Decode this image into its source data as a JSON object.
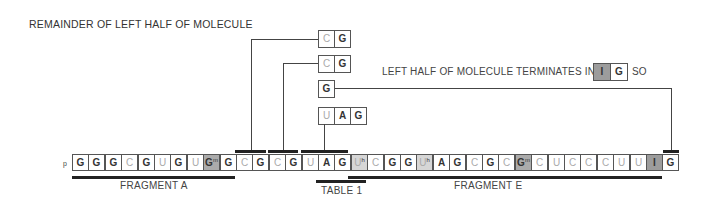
{
  "title": "REMAINDER OF LEFT HALF OF MOLECULE",
  "note": {
    "text": "LEFT HALF OF MOLECULE TERMINATES IN",
    "cells": [
      {
        "base": "I",
        "mod": "",
        "shade": "i"
      },
      {
        "base": "G",
        "mod": "",
        "shade": ""
      }
    ],
    "suffix": "SO"
  },
  "sequence": {
    "prefix": "p",
    "cells": [
      {
        "base": "G",
        "mod": "",
        "shade": ""
      },
      {
        "base": "G",
        "mod": "",
        "shade": ""
      },
      {
        "base": "G",
        "mod": "",
        "shade": ""
      },
      {
        "base": "C",
        "mod": "",
        "shade": ""
      },
      {
        "base": "G",
        "mod": "",
        "shade": ""
      },
      {
        "base": "U",
        "mod": "",
        "shade": ""
      },
      {
        "base": "G",
        "mod": "",
        "shade": ""
      },
      {
        "base": "U",
        "mod": "",
        "shade": ""
      },
      {
        "base": "G",
        "mod": "m",
        "shade": "gm"
      },
      {
        "base": "G",
        "mod": "",
        "shade": ""
      },
      {
        "base": "C",
        "mod": "",
        "shade": ""
      },
      {
        "base": "G",
        "mod": "",
        "shade": ""
      },
      {
        "base": "C",
        "mod": "",
        "shade": ""
      },
      {
        "base": "G",
        "mod": "",
        "shade": ""
      },
      {
        "base": "U",
        "mod": "",
        "shade": ""
      },
      {
        "base": "A",
        "mod": "",
        "shade": ""
      },
      {
        "base": "G",
        "mod": "",
        "shade": ""
      },
      {
        "base": "U",
        "mod": "h",
        "shade": "uh"
      },
      {
        "base": "C",
        "mod": "",
        "shade": ""
      },
      {
        "base": "G",
        "mod": "",
        "shade": ""
      },
      {
        "base": "G",
        "mod": "",
        "shade": ""
      },
      {
        "base": "U",
        "mod": "h",
        "shade": "uh"
      },
      {
        "base": "A",
        "mod": "",
        "shade": ""
      },
      {
        "base": "G",
        "mod": "",
        "shade": ""
      },
      {
        "base": "C",
        "mod": "",
        "shade": ""
      },
      {
        "base": "G",
        "mod": "",
        "shade": ""
      },
      {
        "base": "C",
        "mod": "",
        "shade": ""
      },
      {
        "base": "G",
        "mod": "m",
        "shade": "gm"
      },
      {
        "base": "C",
        "mod": "",
        "shade": ""
      },
      {
        "base": "U",
        "mod": "",
        "shade": ""
      },
      {
        "base": "C",
        "mod": "",
        "shade": ""
      },
      {
        "base": "C",
        "mod": "",
        "shade": ""
      },
      {
        "base": "C",
        "mod": "",
        "shade": ""
      },
      {
        "base": "U",
        "mod": "",
        "shade": ""
      },
      {
        "base": "U",
        "mod": "",
        "shade": ""
      },
      {
        "base": "I",
        "mod": "",
        "shade": "i"
      },
      {
        "base": "G",
        "mod": "",
        "shade": ""
      }
    ]
  },
  "fragments": [
    {
      "label": "FRAGMENT A",
      "from": 0,
      "to": 9
    },
    {
      "label": "TABLE 1",
      "from": 15,
      "to": 17
    },
    {
      "label": "FRAGMENT E",
      "from": 17,
      "to": 35
    }
  ],
  "upper_fragments": [
    {
      "name": "CG-1",
      "cells": [
        {
          "base": "C",
          "mod": "",
          "shade": ""
        },
        {
          "base": "G",
          "mod": "",
          "shade": ""
        }
      ]
    },
    {
      "name": "CG-2",
      "cells": [
        {
          "base": "C",
          "mod": "",
          "shade": ""
        },
        {
          "base": "G",
          "mod": "",
          "shade": ""
        }
      ]
    },
    {
      "name": "G",
      "cells": [
        {
          "base": "G",
          "mod": "",
          "shade": ""
        }
      ]
    },
    {
      "name": "UAG",
      "cells": [
        {
          "base": "U",
          "mod": "",
          "shade": ""
        },
        {
          "base": "A",
          "mod": "",
          "shade": ""
        },
        {
          "base": "G",
          "mod": "",
          "shade": ""
        }
      ]
    }
  ],
  "colors": {
    "modified_g_fill": "#ababab",
    "dihydro_u_fill": "#d6d6d6",
    "inosine_fill": "#9c9c9c",
    "pyrimidine_text": "#aaaaaa",
    "purine_text": "#333333",
    "line": "#444444"
  }
}
